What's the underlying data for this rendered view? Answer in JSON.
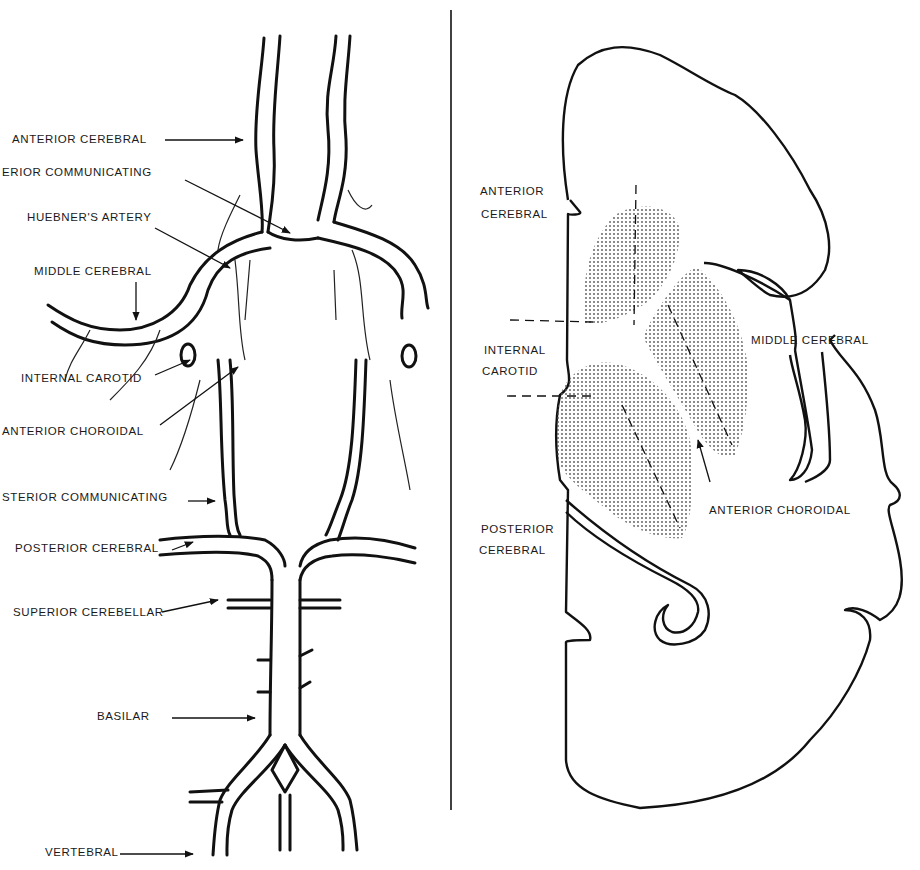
{
  "left_panel": {
    "title": "Arterial circle (base of brain)",
    "labels": [
      {
        "id": "anterior-cerebral",
        "text": "ANTERIOR CEREBRAL",
        "x": 12,
        "y": 131
      },
      {
        "id": "anterior-communicating",
        "text": "ERIOR  COMMUNICATING",
        "x": 2,
        "y": 163
      },
      {
        "id": "huebners-artery",
        "text": "HUEBNER'S ARTERY",
        "x": 27,
        "y": 209
      },
      {
        "id": "middle-cerebral",
        "text": "MIDDLE CEREBRAL",
        "x": 34,
        "y": 262
      },
      {
        "id": "internal-carotid",
        "text": "INTERNAL CAROTID",
        "x": 21,
        "y": 369
      },
      {
        "id": "anterior-choroidal",
        "text": "ANTERIOR CHOROIDAL",
        "x": 2,
        "y": 423
      },
      {
        "id": "posterior-communicating",
        "text": "STERIOR COMMUNICATING",
        "x": 2,
        "y": 488
      },
      {
        "id": "posterior-cerebral",
        "text": "POSTERIOR CEREBRAL",
        "x": 15,
        "y": 539
      },
      {
        "id": "superior-cerebellar",
        "text": "SUPERIOR CEREBELLAR",
        "x": 13,
        "y": 603
      },
      {
        "id": "basilar",
        "text": "BASILAR",
        "x": 97,
        "y": 707
      },
      {
        "id": "vertebral",
        "text": "VERTEBRAL",
        "x": 45,
        "y": 842
      }
    ]
  },
  "right_panel": {
    "title": "Coronal section territories",
    "labels": [
      {
        "id": "anterior-cerebral",
        "text": "ANTERIOR",
        "x": 480,
        "y": 183
      },
      {
        "id": "anterior-cerebral-2",
        "text": "CEREBRAL",
        "x": 481,
        "y": 205
      },
      {
        "id": "middle-cerebral",
        "text": "MIDDLE CEREBRAL",
        "x": 751,
        "y": 330
      },
      {
        "id": "internal-carotid",
        "text": "INTERNAL",
        "x": 484,
        "y": 341
      },
      {
        "id": "internal-carotid-2",
        "text": "CAROTID",
        "x": 482,
        "y": 362
      },
      {
        "id": "anterior-choroidal",
        "text": "ANTERIOR CHOROIDAL",
        "x": 709,
        "y": 500
      },
      {
        "id": "posterior-cerebral",
        "text": "POSTERIOR",
        "x": 481,
        "y": 519
      },
      {
        "id": "posterior-cerebral-2",
        "text": "CEREBRAL",
        "x": 479,
        "y": 540
      }
    ]
  },
  "colors": {
    "ink": "#111111",
    "stipple": "#8a8a8a",
    "background": "#ffffff"
  }
}
